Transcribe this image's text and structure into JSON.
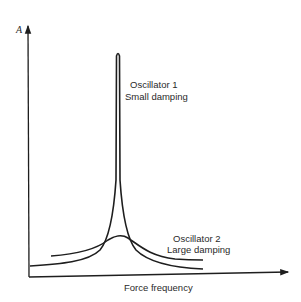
{
  "diagram": {
    "y_axis_label": "A",
    "x_axis_label": "Force frequency",
    "curves": [
      {
        "name": "Oscillator 1",
        "label_line1": "Oscillator 1",
        "label_line2": "Small damping",
        "shape": "sharp narrow resonance peak"
      },
      {
        "name": "Oscillator 2",
        "label_line1": "Oscillator 2",
        "label_line2": "Large damping",
        "shape": "broad low resonance peak"
      }
    ],
    "colors": {
      "line": "#1e1e1e",
      "background": "#ffffff",
      "text": "#2a2a2a"
    }
  }
}
